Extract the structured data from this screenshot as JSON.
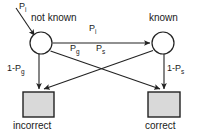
{
  "diagram": {
    "type": "state-transition-diagram",
    "title": "",
    "colors": {
      "stroke": "#222222",
      "node_fill": "#ffffff",
      "terminal_fill": "#d9d9d9",
      "text": "#1a1a1a",
      "background": "#ffffff"
    },
    "states": [
      {
        "id": "not-known",
        "label": "not known",
        "shape": "circle",
        "cx": 41,
        "cy": 43,
        "r": 11
      },
      {
        "id": "known",
        "label": "known",
        "shape": "circle",
        "cx": 163,
        "cy": 43,
        "r": 11
      }
    ],
    "outcomes": [
      {
        "id": "incorrect",
        "label": "incorrect",
        "shape": "rect",
        "x": 23,
        "y": 92,
        "w": 31,
        "h": 25
      },
      {
        "id": "correct",
        "label": "correct",
        "shape": "rect",
        "x": 148,
        "y": 92,
        "w": 32,
        "h": 25
      }
    ],
    "edges": [
      {
        "id": "input-to-not-known",
        "label_base": "P",
        "label_sub": "i",
        "from": "external",
        "to": "not-known"
      },
      {
        "id": "not-known-to-known",
        "label_base": "P",
        "label_sub": "i",
        "from": "not-known",
        "to": "known"
      },
      {
        "id": "not-known-to-correct",
        "label_base": "P",
        "label_sub": "g",
        "from": "not-known",
        "to": "correct"
      },
      {
        "id": "known-to-incorrect",
        "label_base": "P",
        "label_sub": "s",
        "from": "known",
        "to": "incorrect"
      },
      {
        "id": "not-known-to-incorrect",
        "label_base": "1-P",
        "label_sub": "g",
        "from": "not-known",
        "to": "incorrect"
      },
      {
        "id": "known-to-correct",
        "label_base": "1-P",
        "label_sub": "s",
        "from": "known",
        "to": "correct"
      }
    ],
    "labels": {
      "state_not_known": "not known",
      "state_known": "known",
      "outcome_incorrect": "incorrect",
      "outcome_correct": "correct",
      "p_input_base": "P",
      "p_input_sub": "i",
      "p_transition_base": "P",
      "p_transition_sub": "i",
      "p_guess_base": "P",
      "p_guess_sub": "g",
      "p_slip_base": "P",
      "p_slip_sub": "s",
      "p_not_guess_base": "1-P",
      "p_not_guess_sub": "g",
      "p_not_slip_base": "1-P",
      "p_not_slip_sub": "s"
    }
  }
}
